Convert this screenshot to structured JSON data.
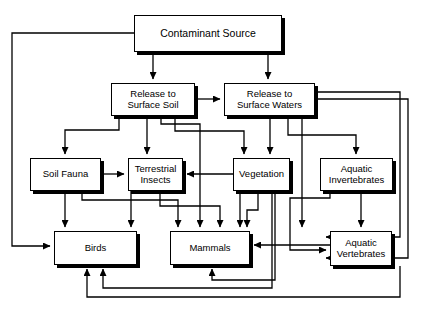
{
  "diagram": {
    "stroke_color": "#000000",
    "background_color": "#ffffff",
    "nodes": [
      {
        "id": "contaminant-source",
        "label": "Contaminant Source",
        "x": 134,
        "y": 15,
        "w": 148,
        "h": 37,
        "font_size": 10.5
      },
      {
        "id": "release-surface-soil",
        "label": "Release to\nSurface Soil",
        "x": 111,
        "y": 83,
        "w": 84,
        "h": 33,
        "font_size": 9.5
      },
      {
        "id": "release-surface-waters",
        "label": "Release to\nSurface Waters",
        "x": 224,
        "y": 83,
        "w": 91,
        "h": 33,
        "font_size": 9.5
      },
      {
        "id": "soil-fauna",
        "label": "Soil Fauna",
        "x": 30,
        "y": 158,
        "w": 71,
        "h": 33,
        "font_size": 9.5
      },
      {
        "id": "terrestrial-insects",
        "label": "Terrestrial\nInsects",
        "x": 128,
        "y": 158,
        "w": 55,
        "h": 33,
        "font_size": 9.5
      },
      {
        "id": "vegetation",
        "label": "Vegetation",
        "x": 233,
        "y": 158,
        "w": 57,
        "h": 33,
        "font_size": 9.5
      },
      {
        "id": "aquatic-invertebrates",
        "label": "Aquatic\nInvertebrates",
        "x": 320,
        "y": 158,
        "w": 73,
        "h": 33,
        "font_size": 9.5
      },
      {
        "id": "birds",
        "label": "Birds",
        "x": 54,
        "y": 231,
        "w": 83,
        "h": 34,
        "font_size": 9.5
      },
      {
        "id": "mammals",
        "label": "Mammals",
        "x": 170,
        "y": 231,
        "w": 80,
        "h": 34,
        "font_size": 9.5
      },
      {
        "id": "aquatic-vertebrates",
        "label": "Aquatic\nVertebrates",
        "x": 330,
        "y": 231,
        "w": 62,
        "h": 35,
        "font_size": 9.5
      }
    ],
    "edges": [
      {
        "id": "source-to-soil",
        "from": "contaminant-source",
        "to": "release-surface-soil",
        "path": "M153,52 L153,79",
        "arrow": "down"
      },
      {
        "id": "source-to-waters",
        "from": "contaminant-source",
        "to": "release-surface-waters",
        "path": "M268,52 L268,79",
        "arrow": "down"
      },
      {
        "id": "source-to-birds",
        "from": "contaminant-source",
        "to": "birds",
        "path": "M134,33 L12,33 L12,246 L50,246",
        "arrow": "right"
      },
      {
        "id": "soil-to-waters",
        "from": "release-surface-soil",
        "to": "release-surface-waters",
        "path": "M195,99 L220,99",
        "arrow": "right"
      },
      {
        "id": "soil-to-soilfauna",
        "from": "release-surface-soil",
        "to": "soil-fauna",
        "path": "M119,116 L119,130 L65,130 L65,154",
        "arrow": "down"
      },
      {
        "id": "soil-to-insects",
        "from": "release-surface-soil",
        "to": "terrestrial-insects",
        "path": "M147,116 L147,154",
        "arrow": "down"
      },
      {
        "id": "soil-to-mammals",
        "from": "release-surface-soil",
        "to": "mammals",
        "path": "M161,116 L161,124 L200,124 L200,227",
        "arrow": "down"
      },
      {
        "id": "soil-to-vegetation",
        "from": "release-surface-soil",
        "to": "vegetation",
        "path": "M175,116 L175,131 L244,131 L244,154",
        "arrow": "down"
      },
      {
        "id": "waters-to-vegetation",
        "from": "release-surface-waters",
        "to": "vegetation",
        "path": "M270,116 L270,154",
        "arrow": "down"
      },
      {
        "id": "waters-to-invertebrates",
        "from": "release-surface-waters",
        "to": "aquatic-invertebrates",
        "path": "M288,116 L288,135 L356,135 L356,154",
        "arrow": "down"
      },
      {
        "id": "waters-to-mammals",
        "from": "release-surface-waters",
        "to": "mammals",
        "path": "M302,116 L302,227",
        "arrow": "down"
      },
      {
        "id": "waters-to-vertebrates",
        "from": "release-surface-waters",
        "to": "aquatic-vertebrates",
        "path": "M315,92 L400,92 L400,237 L326,237",
        "arrow": "right"
      },
      {
        "id": "waters-to-vertebrates-2",
        "from": "release-surface-waters",
        "to": "aquatic-vertebrates",
        "path": "M315,99 L408,99 L408,258 L326,258",
        "arrow": "right"
      },
      {
        "id": "soilfauna-to-insects",
        "from": "soil-fauna",
        "to": "terrestrial-insects",
        "path": "M101,174 L124,174",
        "arrow": "right"
      },
      {
        "id": "soilfauna-to-birds",
        "from": "soil-fauna",
        "to": "birds",
        "path": "M65,191 L65,227",
        "arrow": "down"
      },
      {
        "id": "soilfauna-to-mammals",
        "from": "soil-fauna",
        "to": "mammals",
        "path": "M82,191 L82,200 L178,200 L178,227",
        "arrow": "down"
      },
      {
        "id": "vegetation-to-insects",
        "from": "vegetation",
        "to": "terrestrial-insects",
        "path": "M233,174 L187,174",
        "arrow": "left"
      },
      {
        "id": "insects-to-birds",
        "from": "terrestrial-insects",
        "to": "birds",
        "path": "M131,191 L131,227",
        "arrow": "down"
      },
      {
        "id": "insects-to-mammals",
        "from": "terrestrial-insects",
        "to": "mammals",
        "path": "M160,191 L160,206 L220,206 L220,227",
        "arrow": "down"
      },
      {
        "id": "vegetation-to-mammals",
        "from": "vegetation",
        "to": "mammals",
        "path": "M240,191 L240,227",
        "arrow": "down"
      },
      {
        "id": "vegetation-to-mammals-2",
        "from": "vegetation",
        "to": "mammals",
        "path": "M258,191 L258,210 L247,210 L247,227",
        "arrow": "down"
      },
      {
        "id": "vegetation-to-birds",
        "from": "vegetation",
        "to": "birds",
        "path": "M272,191 L272,288 L103,288 L103,269",
        "arrow": "up"
      },
      {
        "id": "invertebrates-to-vertebrates",
        "from": "aquatic-invertebrates",
        "to": "aquatic-vertebrates",
        "path": "M361,191 L361,227",
        "arrow": "down"
      },
      {
        "id": "invertebrates-to-vertebrates-2",
        "from": "aquatic-invertebrates",
        "to": "aquatic-vertebrates",
        "path": "M330,191 L330,198 L290,198 L290,250 L326,250",
        "arrow": "right"
      },
      {
        "id": "vertebrates-to-mammals",
        "from": "aquatic-vertebrates",
        "to": "mammals",
        "path": "M330,245 L254,245",
        "arrow": "left"
      },
      {
        "id": "vertebrates-to-birds",
        "from": "aquatic-vertebrates",
        "to": "birds",
        "path": "M400,266 L400,297 L87,297 L87,269",
        "arrow": "up"
      },
      {
        "id": "vertebrates-to-mammals-2",
        "from": "aquatic-vertebrates",
        "to": "mammals",
        "path": "M275,191 L275,280 L212,280 L212,269",
        "arrow": "up"
      }
    ]
  }
}
